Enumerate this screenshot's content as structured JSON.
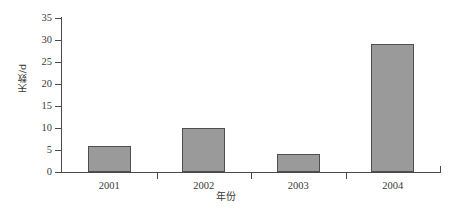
{
  "chart_data": {
    "type": "bar",
    "title": "",
    "subtitle": "",
    "xlabel": "年份",
    "ylabel": "天数/d",
    "categories": [
      "2001",
      "2002",
      "2003",
      "2004"
    ],
    "values": [
      6,
      10,
      4,
      29
    ],
    "series": [
      {
        "name": "天数",
        "values": [
          6,
          10,
          4,
          29
        ]
      }
    ],
    "ylim": [
      0,
      35
    ],
    "ytick_values": [
      0,
      5,
      10,
      15,
      20,
      25,
      30,
      35
    ],
    "ytick_labels": [
      "0",
      "5",
      "10",
      "15",
      "20",
      "25",
      "30",
      "35"
    ],
    "xtick_labels": [
      "2001",
      "2002",
      "2003",
      "2004"
    ],
    "grid": false,
    "legend": false,
    "legend_position": "none",
    "bar_color": "#9a9a9a",
    "bar_edge_color": "#4f4f4f",
    "axis_color": "#4a4a4a",
    "background_color": "#ffffff",
    "tick_direction": "out",
    "annotations": []
  }
}
